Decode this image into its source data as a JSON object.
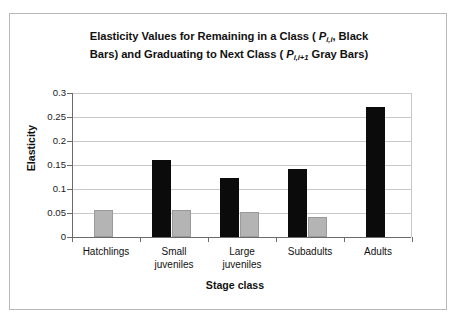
{
  "chart_data": {
    "type": "bar",
    "title": "Elasticity Values for Remaining in a Class ( Pi,i, Black Bars) and Graduating to Next Class ( Pi,i+1 Gray Bars)",
    "title_line1_pre": "Elasticity Values for Remaining in a Class ( ",
    "title_line1_var": "P",
    "title_line1_sub": "i,i",
    "title_line1_post": ", Black",
    "title_line2_pre": "Bars) and Graduating to Next Class ( ",
    "title_line2_var": "P",
    "title_line2_sub": "i,i+1",
    "title_line2_post": " Gray Bars)",
    "xlabel": "Stage class",
    "ylabel": "Elasticity",
    "categories": [
      "Hatchlings",
      "Small juveniles",
      "Large juveniles",
      "Subadults",
      "Adults"
    ],
    "category_lines": [
      [
        "Hatchlings"
      ],
      [
        "Small",
        "juveniles"
      ],
      [
        "Large",
        "juveniles"
      ],
      [
        "Subadults"
      ],
      [
        "Adults"
      ]
    ],
    "series": [
      {
        "name": "Remaining in a Class (Pi,i, Black Bars)",
        "color": "#0b0b0b",
        "values": [
          null,
          0.161,
          0.122,
          0.142,
          0.27
        ]
      },
      {
        "name": "Graduating to Next Class (Pi,i+1 Gray Bars)",
        "color": "#b4b4b4",
        "values": [
          0.057,
          0.056,
          0.053,
          0.042,
          null
        ]
      }
    ],
    "ylim": [
      0,
      0.3
    ],
    "ytick_labels": [
      "0.3",
      "0.25",
      "0.2",
      "0.15",
      "0.1",
      "0.05",
      "0"
    ],
    "ytick_values": [
      0.3,
      0.25,
      0.2,
      0.15,
      0.1,
      0.05,
      0
    ],
    "grid": true,
    "legend": "none"
  }
}
